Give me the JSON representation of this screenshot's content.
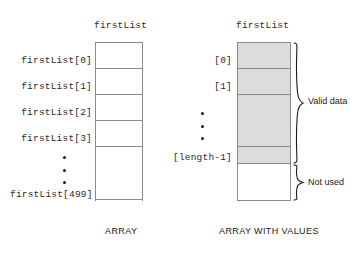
{
  "figure": {
    "title_left": "firstList",
    "title_right": "firstList",
    "caption_left": "ARRAY",
    "caption_right": "ARRAY WITH VALUES"
  },
  "left_array": {
    "name": "firstList",
    "caption": "ARRAY",
    "labels": [
      "firstList[0]",
      "firstList[1]",
      "firstList[2]",
      "firstList[3]",
      "firstList[499]"
    ],
    "ellipsis": "vertical-ellipsis",
    "cell_count_shown": 6,
    "total_elements": 500
  },
  "right_array": {
    "name": "firstList",
    "caption": "ARRAY WITH VALUES",
    "labels": [
      "[0]",
      "[1]",
      "[length-1]"
    ],
    "ellipsis": "vertical-ellipsis",
    "annotations": [
      "Valid data",
      "Not used"
    ],
    "shaded_color": "#dcdcdc",
    "unshaded_color": "#ffffff"
  },
  "icons": {
    "ellipsis": "vertical-ellipsis-icon",
    "brace_valid": "curly-brace-icon",
    "brace_unused": "curly-brace-icon"
  },
  "colors": {
    "border": "#8a8a8a",
    "shaded_fill": "#dcdcdc",
    "text": "#2b2b2b",
    "background": "#ffffff"
  }
}
